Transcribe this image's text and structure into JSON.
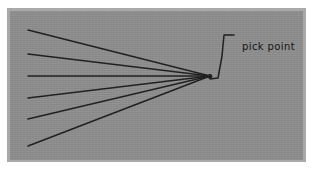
{
  "figure": {
    "background_color": "#ffffff",
    "plate_color": "#8e8e8e",
    "plate_border_color": "#a9a9a9",
    "ink_color": "#1d1d1d"
  },
  "annotations": {
    "pick_point_label": "pick point"
  },
  "chart_data": {
    "type": "scatter",
    "title": "",
    "subtitle": "",
    "xlabel": "",
    "ylabel": "",
    "xlim": [
      0,
      293
    ],
    "ylim": [
      0,
      149
    ],
    "grid": false,
    "legend_position": "none",
    "pick_point": {
      "x": 200,
      "y": 65
    },
    "rays": [
      {
        "name": "ray-1",
        "x0": 18,
        "y0": 19,
        "x1": 200,
        "y1": 65
      },
      {
        "name": "ray-2",
        "x0": 18,
        "y0": 43,
        "x1": 200,
        "y1": 65
      },
      {
        "name": "ray-3",
        "x0": 18,
        "y0": 65,
        "x1": 200,
        "y1": 65
      },
      {
        "name": "ray-4",
        "x0": 18,
        "y0": 87,
        "x1": 200,
        "y1": 65
      },
      {
        "name": "ray-5",
        "x0": 18,
        "y0": 108,
        "x1": 200,
        "y1": 65
      },
      {
        "name": "ray-6",
        "x0": 18,
        "y0": 135,
        "x1": 200,
        "y1": 65
      }
    ],
    "leader": {
      "name": "pick-point-leader",
      "points": [
        [
          200,
          68
        ],
        [
          208,
          67
        ],
        [
          212,
          45
        ],
        [
          214,
          24
        ],
        [
          224,
          24
        ]
      ]
    },
    "annotations": [
      {
        "text": "pick point",
        "x": 226,
        "y": 19
      }
    ]
  }
}
